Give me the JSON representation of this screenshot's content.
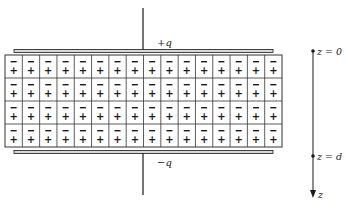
{
  "figure": {
    "type": "capacitor-with-polarized-dielectric",
    "plates": {
      "top": {
        "label": "+q",
        "charge_sign": "+"
      },
      "bottom": {
        "label": "−q",
        "charge_sign": "−"
      }
    },
    "dielectric": {
      "rows": 4,
      "columns": 16,
      "cell_top_symbol": "−",
      "cell_bottom_symbol": "+"
    },
    "axis": {
      "name": "z",
      "direction": "down",
      "markers": [
        {
          "label": "z = 0",
          "position": "top plate"
        },
        {
          "label": "z = d",
          "position": "bottom plate"
        }
      ],
      "arrow_label": "z"
    }
  },
  "colors": {
    "line": "#1a1a1a",
    "plate_fill": "#d8d8d8",
    "grid": "#333333",
    "background": "#ffffff"
  }
}
